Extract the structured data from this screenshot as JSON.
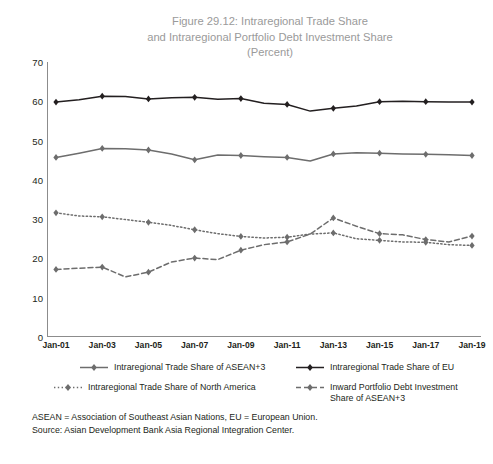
{
  "title": {
    "line1": "Figure 29.12: Intraregional Trade Share",
    "line2": "and Intraregional Portfolio Debt Investment Share",
    "line3": "(Percent)"
  },
  "footnotes": {
    "definitions": "ASEAN = Association of Southeast Asian Nations, EU = European Union.",
    "source": "Source: Asian Development Bank Asia Regional Integration Center."
  },
  "colors": {
    "eu": "#231f20",
    "asean": "#6d6d6d",
    "north_america": "#6d6d6d",
    "inward_debt": "#6d6d6d",
    "axis": "#8c8c8c",
    "title": "#9a9a9a",
    "text": "#231f20"
  },
  "chart_data": {
    "type": "line",
    "title": "Figure 29.12: Intraregional Trade Share and Intraregional Portfolio Debt Investment Share (Percent)",
    "xlabel": "",
    "ylabel": "",
    "ylim": [
      0,
      70
    ],
    "yticks": [
      0,
      10,
      20,
      30,
      40,
      50,
      60,
      70
    ],
    "grid": false,
    "legend_position": "bottom",
    "x": [
      "Jan-01",
      "Jan-02",
      "Jan-03",
      "Jan-04",
      "Jan-05",
      "Jan-06",
      "Jan-07",
      "Jan-08",
      "Jan-09",
      "Jan-10",
      "Jan-11",
      "Jan-12",
      "Jan-13",
      "Jan-14",
      "Jan-15",
      "Jan-16",
      "Jan-17",
      "Jan-18",
      "Jan-19"
    ],
    "xticklabels": [
      "Jan-01",
      "Jan-03",
      "Jan-05",
      "Jan-07",
      "Jan-09",
      "Jan-11",
      "Jan-13",
      "Jan-15",
      "Jan-17",
      "Jan-19"
    ],
    "series": [
      {
        "name": "Intraregional Trade Share of ASEAN+3",
        "style": "solid",
        "color": "#6d6d6d",
        "values": [
          45.7,
          46.8,
          48.0,
          47.9,
          47.6,
          46.6,
          45.1,
          46.3,
          46.2,
          45.9,
          45.7,
          44.8,
          46.6,
          46.9,
          46.8,
          46.6,
          46.5,
          46.4,
          46.2
        ]
      },
      {
        "name": "Intraregional Trade Share of EU",
        "style": "solid",
        "color": "#231f20",
        "values": [
          59.8,
          60.4,
          61.3,
          61.2,
          60.6,
          60.9,
          61.0,
          60.5,
          60.7,
          59.5,
          59.2,
          57.5,
          58.2,
          58.8,
          59.9,
          60.0,
          59.9,
          59.8,
          59.8
        ]
      },
      {
        "name": "Intraregional Trade Share of North America",
        "style": "dotted",
        "color": "#6d6d6d",
        "values": [
          31.6,
          30.8,
          30.6,
          29.9,
          29.2,
          28.4,
          27.3,
          26.3,
          25.6,
          25.2,
          25.4,
          26.2,
          26.5,
          25.0,
          24.6,
          24.2,
          24.1,
          23.5,
          23.3
        ]
      },
      {
        "name": "Inward Portfolio Debt Investment Share of ASEAN+3",
        "style": "dashed",
        "color": "#6d6d6d",
        "values": [
          17.2,
          17.5,
          17.8,
          15.3,
          16.5,
          19.1,
          20.1,
          19.7,
          22.1,
          23.5,
          24.2,
          26.2,
          30.3,
          28.2,
          26.3,
          26.0,
          24.8,
          24.2,
          25.7
        ]
      }
    ]
  },
  "legend": [
    {
      "label": "Intraregional Trade Share of ASEAN+3",
      "style": "solid",
      "color": "#6d6d6d"
    },
    {
      "label": "Intraregional Trade Share of EU",
      "style": "solid",
      "color": "#231f20"
    },
    {
      "label": "Intraregional Trade Share of North America",
      "style": "dotted",
      "color": "#6d6d6d"
    },
    {
      "label": "Inward Portfolio Debt Investment Share of ASEAN+3",
      "style": "dashed",
      "color": "#6d6d6d"
    }
  ]
}
